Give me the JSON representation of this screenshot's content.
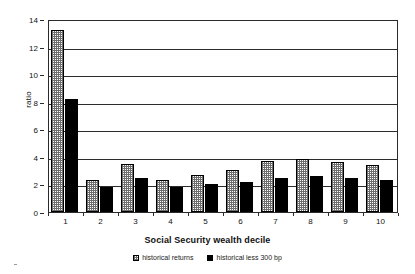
{
  "chart_data": {
    "type": "bar",
    "title": "",
    "xlabel": "Social Security wealth decile",
    "ylabel": "ratio",
    "categories": [
      "1",
      "2",
      "3",
      "4",
      "5",
      "6",
      "7",
      "8",
      "9",
      "10"
    ],
    "series": [
      {
        "name": "historical returns",
        "values": [
          13.2,
          2.3,
          3.5,
          2.35,
          2.7,
          3.05,
          3.7,
          3.85,
          3.65,
          3.4
        ]
      },
      {
        "name": "historical less 300 bp",
        "values": [
          8.2,
          1.85,
          2.45,
          1.85,
          2.05,
          2.2,
          2.5,
          2.6,
          2.5,
          2.35
        ]
      }
    ],
    "ylim": [
      0,
      14
    ],
    "y_ticks": [
      0,
      2,
      4,
      6,
      8,
      10,
      12,
      14
    ],
    "grid": true,
    "legend_position": "bottom",
    "colors": {
      "series_0": "#6e6e6e",
      "series_1": "#000000",
      "axis": "#2b2b2b",
      "background": "#ffffff"
    }
  },
  "legend": {
    "items": [
      {
        "label": "historical returns"
      },
      {
        "label": "historical less 300 bp"
      }
    ]
  }
}
